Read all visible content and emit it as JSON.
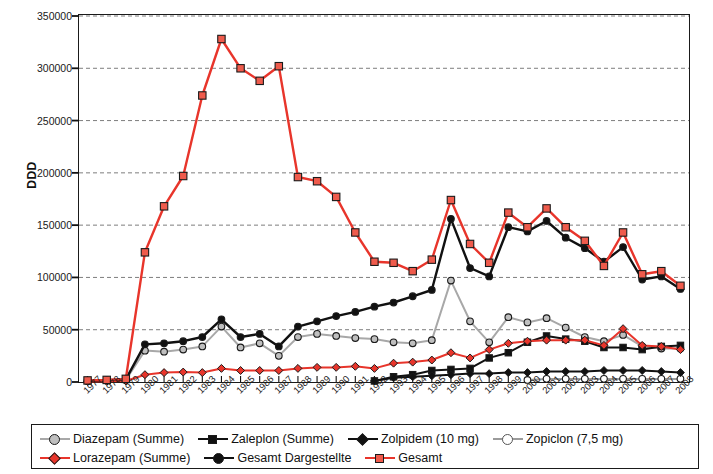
{
  "chart_data": {
    "type": "line",
    "title": "",
    "xlabel": "",
    "ylabel": "DDD",
    "ylim": [
      0,
      350000
    ],
    "ytick_values": [
      0,
      50000,
      100000,
      150000,
      200000,
      250000,
      300000,
      350000
    ],
    "ytick_labels": [
      "0",
      "50000",
      "100000",
      "150000",
      "200000",
      "250000",
      "300000",
      "350000"
    ],
    "grid": true,
    "grid_style": "dashed-horizontal",
    "legend_position": "below-plot",
    "categories": [
      "1977",
      "1978",
      "1979",
      "1980",
      "1981",
      "1982",
      "1983",
      "1984",
      "1985",
      "1986",
      "1987",
      "1988",
      "1989",
      "1990",
      "1991",
      "1992",
      "1993",
      "1994",
      "1995",
      "1996",
      "1997",
      "1998",
      "1999",
      "2000",
      "2001",
      "2002",
      "2003",
      "2004",
      "2005",
      "2006",
      "2007",
      "2008"
    ],
    "series": [
      {
        "name": "Diazepam (Summe)",
        "color": "#a8a8a8",
        "marker": "circle",
        "marker_fill": "#bfbfbf",
        "values": [
          1000,
          1500,
          2000,
          30000,
          29000,
          31000,
          34000,
          53000,
          33000,
          37000,
          25000,
          43000,
          46000,
          44000,
          42000,
          41000,
          38000,
          37000,
          40000,
          97000,
          58000,
          38000,
          62000,
          57000,
          61000,
          52000,
          43000,
          39000,
          45000,
          34000,
          32000,
          32000
        ]
      },
      {
        "name": "Lorazepam (Summe)",
        "color": "#e8352b",
        "marker": "diamond",
        "marker_fill": "#e8352b",
        "values": [
          500,
          700,
          1000,
          7000,
          9000,
          9500,
          9000,
          13000,
          11000,
          11000,
          11000,
          13000,
          14000,
          14000,
          15000,
          13000,
          18000,
          19000,
          21000,
          28000,
          23000,
          31000,
          37000,
          39000,
          40000,
          40000,
          40000,
          35000,
          51000,
          35000,
          34000,
          31000
        ]
      },
      {
        "name": "Zaleplon (Summe)",
        "color": "#111111",
        "marker": "square",
        "marker_fill": "#111111",
        "values": [
          null,
          null,
          null,
          null,
          null,
          null,
          null,
          null,
          null,
          null,
          null,
          null,
          null,
          null,
          null,
          1000,
          5000,
          7000,
          11000,
          12000,
          13000,
          23000,
          28000,
          38000,
          44000,
          41000,
          39000,
          33000,
          33000,
          31000,
          34000,
          35000
        ]
      },
      {
        "name": "Gesamt Dargestellte",
        "color": "#111111",
        "marker": "circle",
        "marker_fill": "#111111",
        "values": [
          1200,
          1800,
          2500,
          36000,
          37000,
          39000,
          43000,
          60000,
          43000,
          46000,
          34000,
          53000,
          58000,
          63000,
          67000,
          72000,
          76000,
          82000,
          88000,
          156000,
          109000,
          101000,
          148000,
          144000,
          154000,
          138000,
          128000,
          115000,
          129000,
          98000,
          101000,
          89000
        ]
      },
      {
        "name": "Zolpidem (10 mg)",
        "color": "#111111",
        "marker": "diamond",
        "marker_fill": "#111111",
        "values": [
          null,
          null,
          null,
          null,
          null,
          null,
          null,
          null,
          null,
          null,
          null,
          null,
          null,
          null,
          null,
          1000,
          4000,
          5000,
          6000,
          7000,
          8000,
          8000,
          9000,
          9000,
          10000,
          10000,
          10000,
          11000,
          11000,
          11000,
          10000,
          9000
        ]
      },
      {
        "name": "Zopiclon (7,5 mg)",
        "color": "#9b9b9b",
        "marker": "circle",
        "marker_fill": "#ffffff",
        "values": [
          null,
          null,
          null,
          null,
          null,
          null,
          null,
          null,
          null,
          null,
          null,
          null,
          null,
          null,
          null,
          null,
          null,
          null,
          null,
          null,
          null,
          null,
          null,
          2000,
          3000,
          3000,
          3000,
          3000,
          3000,
          3000,
          3000,
          3000
        ]
      },
      {
        "name": "Gesamt",
        "color": "#e8352b",
        "marker": "square",
        "marker_fill": "#ef5b4c",
        "values": [
          1500,
          2000,
          3000,
          124000,
          168000,
          197000,
          274000,
          328000,
          300000,
          288000,
          302000,
          196000,
          192000,
          177000,
          143000,
          115000,
          114000,
          106000,
          117000,
          174000,
          132000,
          114000,
          162000,
          148000,
          166000,
          148000,
          135000,
          111000,
          143000,
          103000,
          106000,
          92000
        ]
      }
    ]
  },
  "axis": {
    "y_label": "DDD"
  },
  "legend": {
    "row1": [
      {
        "label": "Diazepam (Summe)",
        "color": "#a8a8a8",
        "fill": "#bfbfbf",
        "marker": "circle"
      },
      {
        "label": "Zaleplon (Summe)",
        "color": "#111111",
        "fill": "#111111",
        "marker": "square"
      },
      {
        "label": "Zolpidem (10 mg)",
        "color": "#111111",
        "fill": "#111111",
        "marker": "diamond"
      },
      {
        "label": "Zopiclon (7,5 mg)",
        "color": "#9b9b9b",
        "fill": "#ffffff",
        "marker": "circle"
      }
    ],
    "row2": [
      {
        "label": "Lorazepam (Summe)",
        "color": "#e8352b",
        "fill": "#e8352b",
        "marker": "diamond"
      },
      {
        "label": "Gesamt Dargestellte",
        "color": "#111111",
        "fill": "#111111",
        "marker": "circle"
      },
      {
        "label": "Gesamt",
        "color": "#e8352b",
        "fill": "#ef5b4c",
        "marker": "square"
      }
    ]
  }
}
